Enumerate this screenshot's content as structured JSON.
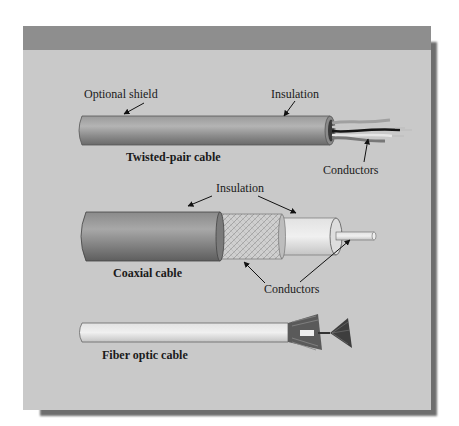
{
  "figure": {
    "title": "",
    "colors": {
      "panel_header": "#8e8e8e",
      "panel_body": "#c9c9c9",
      "shadow": "#6e6e6e"
    }
  },
  "cables": [
    {
      "name": "Twisted-pair cable",
      "labels": [
        "Optional shield",
        "Insulation",
        "Conductors"
      ]
    },
    {
      "name": "Coaxial cable",
      "labels": [
        "Insulation",
        "Conductors"
      ]
    },
    {
      "name": "Fiber optic cable",
      "labels": []
    }
  ]
}
